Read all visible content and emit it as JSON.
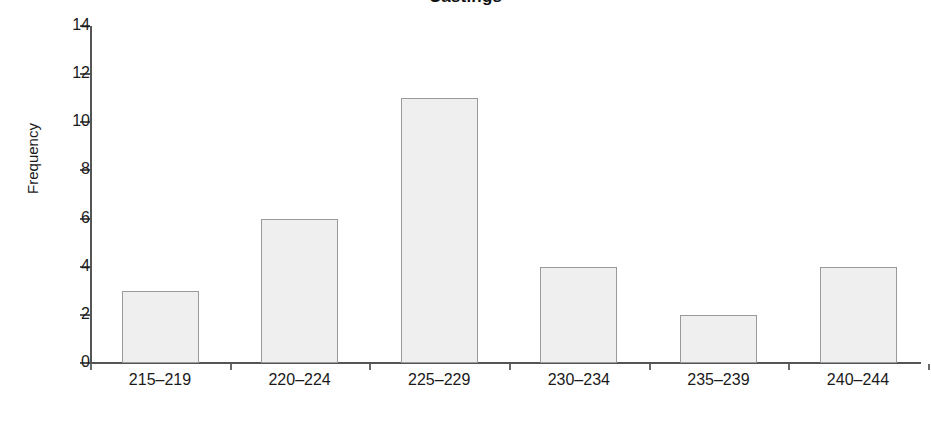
{
  "chart_data": {
    "type": "bar",
    "title": "Castings",
    "xlabel": "",
    "ylabel": "Frequency",
    "categories": [
      "215–219",
      "220–224",
      "225–229",
      "230–234",
      "235–239",
      "240–244"
    ],
    "values": [
      3,
      6,
      11,
      4,
      2,
      4
    ],
    "ylim": [
      0,
      14
    ],
    "yticks": [
      0,
      2,
      4,
      6,
      8,
      10,
      12,
      14
    ],
    "ytick_labels": [
      "0",
      "2",
      "4",
      "6",
      "8",
      "10",
      "12",
      "14"
    ],
    "grid": false,
    "legend": null,
    "colors": {
      "bar_fill": "#efefef",
      "bar_border": "#9a9a9a",
      "axis": "#555555",
      "text": "#1a1a1a",
      "background": "#ffffff"
    }
  }
}
